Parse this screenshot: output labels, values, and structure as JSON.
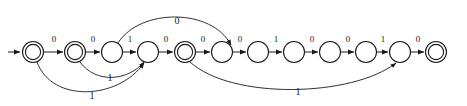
{
  "diagram": {
    "type": "finite-state-automaton",
    "title": "",
    "geometry": {
      "width": 467,
      "height": 106,
      "baseline_y": 52,
      "radius": 10.5,
      "inner_radius": 7.6
    },
    "start_arrow": {
      "from_x": 8,
      "to_x": 21,
      "y": 52
    },
    "states": [
      {
        "id": "q1",
        "cx": 33,
        "cy": 52,
        "accepting": true
      },
      {
        "id": "q2",
        "cx": 75,
        "cy": 52,
        "accepting": true
      },
      {
        "id": "q3",
        "cx": 112,
        "cy": 52,
        "accepting": false
      },
      {
        "id": "q4",
        "cx": 148,
        "cy": 52,
        "accepting": false
      },
      {
        "id": "q5",
        "cx": 185,
        "cy": 52,
        "accepting": true
      },
      {
        "id": "q6",
        "cx": 222,
        "cy": 52,
        "accepting": false
      },
      {
        "id": "q7",
        "cx": 258,
        "cy": 52,
        "accepting": false
      },
      {
        "id": "q8",
        "cx": 294,
        "cy": 52,
        "accepting": false
      },
      {
        "id": "q9",
        "cx": 330,
        "cy": 52,
        "accepting": false
      },
      {
        "id": "q10",
        "cx": 366,
        "cy": 52,
        "accepting": false
      },
      {
        "id": "q11",
        "cx": 400,
        "cy": 52,
        "accepting": false
      },
      {
        "id": "q12",
        "cx": 436,
        "cy": 52,
        "accepting": true
      }
    ],
    "linear_transitions": [
      {
        "from": "q1",
        "to": "q2",
        "label": "0",
        "x1": 44,
        "x2": 64,
        "lx": 54,
        "ly": 40
      },
      {
        "from": "q2",
        "to": "q3",
        "label": "0",
        "x1": 86,
        "x2": 101,
        "lx": 93,
        "ly": 40
      },
      {
        "from": "q3",
        "to": "q4",
        "label": "1",
        "x1": 123,
        "x2": 137,
        "lx": 130,
        "ly": 40
      },
      {
        "from": "q4",
        "to": "q5",
        "label": "0",
        "x1": 159,
        "x2": 174,
        "lx": 166,
        "ly": 40
      },
      {
        "from": "q5",
        "to": "q6",
        "label": "0",
        "x1": 196,
        "x2": 211,
        "lx": 203,
        "ly": 40
      },
      {
        "from": "q6",
        "to": "q7",
        "label": "0",
        "x1": 233,
        "x2": 247,
        "lx": 240,
        "ly": 40
      },
      {
        "from": "q7",
        "to": "q8",
        "label": "1",
        "x1": 269,
        "x2": 283,
        "lx": 276,
        "ly": 40
      },
      {
        "from": "q8",
        "to": "q9",
        "label": "0",
        "x1": 305,
        "x2": 319,
        "lx": 312,
        "ly": 40
      },
      {
        "from": "q9",
        "to": "q10",
        "label": "0",
        "x1": 341,
        "x2": 355,
        "lx": 348,
        "ly": 40
      },
      {
        "from": "q10",
        "to": "q11",
        "label": "1",
        "x1": 377,
        "x2": 389,
        "lx": 383,
        "ly": 40
      },
      {
        "from": "q11",
        "to": "q12",
        "label": "0",
        "x1": 411,
        "x2": 425,
        "lx": 418,
        "ly": 40
      }
    ],
    "curved_transitions": [
      {
        "name": "top-arc-q3-to-q6",
        "label": "0",
        "direction": "above",
        "path": "M 118 43 C 140 8, 210 8, 230 45",
        "label_x": 177,
        "label_y": 22
      },
      {
        "name": "bottom-arc-q2-to-q4",
        "label": "1",
        "direction": "below",
        "path": "M 79 62 C 95 84, 128 82, 145 62",
        "label_x": 110,
        "label_y": 79
      },
      {
        "name": "bottom-arc-q1-to-q4",
        "label": "1",
        "direction": "below",
        "path": "M 38 62 C 55 104, 120 100, 145 63",
        "label_x": 92,
        "label_y": 97
      },
      {
        "name": "bottom-arc-q5-to-q11",
        "label": "1",
        "direction": "below",
        "path": "M 190 62 C 230 100, 350 98, 397 63",
        "label_x": 298,
        "label_y": 93
      }
    ],
    "alphabet": [
      "0",
      "1"
    ],
    "labels": {
      "zero": "0",
      "one": "1"
    }
  }
}
